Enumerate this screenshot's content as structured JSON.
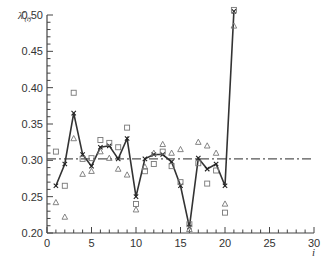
{
  "chart_data": {
    "type": "line",
    "title": "",
    "xlabel": "i",
    "ylabel": "λ̄(i)",
    "xlim": [
      0,
      30
    ],
    "ylim": [
      0.2,
      0.5
    ],
    "xticks": [
      0,
      5,
      10,
      15,
      20,
      25,
      30
    ],
    "yticks": [
      0.2,
      0.25,
      0.3,
      0.35,
      0.4,
      0.45,
      0.5
    ],
    "ytick_labels": [
      "0.20",
      "0.25",
      "0.30",
      "0.35",
      "0.40",
      "0.45",
      "0.50"
    ],
    "grid": false,
    "legend": null,
    "x": [
      1,
      2,
      3,
      4,
      5,
      6,
      7,
      8,
      9,
      10,
      11,
      12,
      13,
      14,
      15,
      16,
      17,
      18,
      19,
      20,
      21
    ],
    "series": [
      {
        "name": "cross (connected line)",
        "marker": "x",
        "line": "solid",
        "values": [
          0.265,
          0.295,
          0.365,
          0.308,
          0.292,
          0.318,
          0.32,
          0.302,
          0.33,
          0.25,
          0.302,
          0.308,
          0.308,
          0.298,
          0.265,
          0.208,
          0.303,
          0.288,
          0.295,
          0.265,
          0.505
        ]
      },
      {
        "name": "square",
        "marker": "square",
        "line": "none",
        "values": [
          0.312,
          0.265,
          0.393,
          0.302,
          0.303,
          0.328,
          0.324,
          0.318,
          0.345,
          0.24,
          0.285,
          0.295,
          0.312,
          0.292,
          0.27,
          0.212,
          0.296,
          0.268,
          0.286,
          0.228,
          0.507
        ]
      },
      {
        "name": "triangle",
        "marker": "triangle",
        "line": "none",
        "values": [
          0.242,
          0.222,
          0.33,
          0.281,
          0.285,
          0.312,
          0.303,
          0.288,
          0.28,
          0.232,
          0.291,
          0.31,
          0.322,
          0.31,
          0.315,
          0.205,
          0.325,
          0.32,
          0.31,
          0.24,
          0.485
        ]
      }
    ],
    "reference_line": {
      "style": "dash-dot",
      "y": 0.302,
      "x_range": [
        0,
        30
      ]
    }
  }
}
